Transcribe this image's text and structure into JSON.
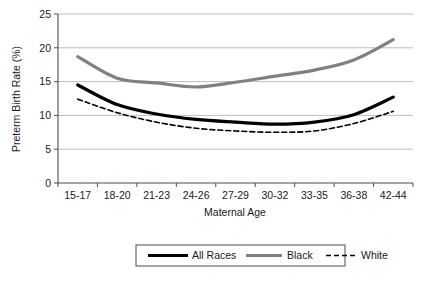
{
  "chart_data": {
    "type": "line",
    "title": "",
    "xlabel": "Maternal Age",
    "ylabel": "Preterm Birth Rate (%)",
    "categories": [
      "15-17",
      "18-20",
      "21-23",
      "24-26",
      "27-29",
      "30-32",
      "33-35",
      "36-38",
      "42-44"
    ],
    "series": [
      {
        "name": "All Races",
        "color": "#000000",
        "style": "solid",
        "width": 3.2,
        "values": [
          14.5,
          11.6,
          10.2,
          9.4,
          9.0,
          8.7,
          9.0,
          10.1,
          12.7
        ]
      },
      {
        "name": "Black",
        "color": "#808080",
        "style": "solid",
        "width": 3.2,
        "values": [
          18.7,
          15.5,
          14.8,
          14.2,
          14.9,
          15.8,
          16.7,
          18.2,
          21.2
        ]
      },
      {
        "name": "White",
        "color": "#000000",
        "style": "dashed",
        "width": 1.6,
        "values": [
          12.4,
          10.4,
          9.0,
          8.1,
          7.7,
          7.5,
          7.7,
          8.8,
          10.6
        ]
      }
    ],
    "ylim": [
      0,
      25
    ],
    "yticks": [
      0,
      5,
      10,
      15,
      20,
      25
    ],
    "ytick_labels": [
      "0",
      "5",
      "10",
      "15",
      "20",
      "25"
    ],
    "grid": true,
    "grid_axis": "y",
    "legend_position": "bottom",
    "legend_entries": [
      "All Races",
      "Black",
      "White"
    ]
  },
  "colors": {
    "black_series": "#000000",
    "gray_series": "#808080",
    "grid": "#b5b5b5",
    "axis": "#4d4d4d",
    "background": "#ffffff"
  }
}
